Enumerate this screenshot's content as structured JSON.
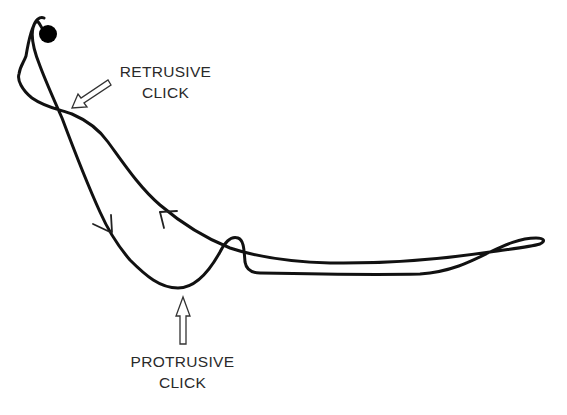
{
  "diagram": {
    "type": "jaw-movement-tracing",
    "colors": {
      "trace": "#111111",
      "arrow_outline": "#333333",
      "text": "#2a2a2a",
      "background": "#ffffff"
    },
    "start_marker": "filled-circle",
    "labels": {
      "retrusive": {
        "line1": "RETRUSIVE",
        "line2": "CLICK"
      },
      "protrusive": {
        "line1": "PROTRUSIVE",
        "line2": "CLICK"
      }
    },
    "direction_arrows": [
      {
        "name": "downward-direction-arrow",
        "direction": "down"
      },
      {
        "name": "upward-direction-arrow",
        "direction": "up"
      }
    ]
  }
}
